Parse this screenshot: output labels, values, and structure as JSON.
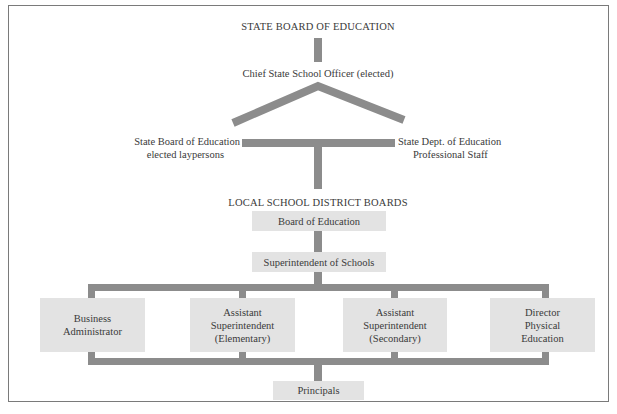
{
  "diagram": {
    "type": "org-chart",
    "state_level": {
      "heading": "STATE BOARD OF EDUCATION",
      "chief": "Chief State School Officer (elected)",
      "left_branch": {
        "line1": "State Board of Education",
        "line2": "elected laypersons"
      },
      "right_branch": {
        "line1": "State Dept. of Education",
        "line2": "Professional Staff"
      }
    },
    "local_level": {
      "heading": "LOCAL SCHOOL DISTRICT BOARDS",
      "board": "Board of Education",
      "superintendent": "Superintendent of Schools",
      "departments": [
        {
          "lines": [
            "Business",
            "Administrator"
          ]
        },
        {
          "lines": [
            "Assistant",
            "Superintendent",
            "(Elementary)"
          ]
        },
        {
          "lines": [
            "Assistant",
            "Superintendent",
            "(Secondary)"
          ]
        },
        {
          "lines": [
            "Director",
            "Physical",
            "Education"
          ]
        }
      ],
      "principals": "Principals"
    },
    "colors": {
      "connector": "#8c8c8c",
      "box_fill": "#e3e3e3",
      "frame": "#7a7a7a",
      "text": "#3a3a3a"
    }
  }
}
